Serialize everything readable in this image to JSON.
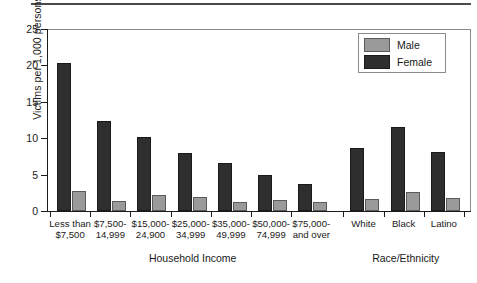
{
  "chart_data": {
    "type": "bar",
    "title": "",
    "xlabel": "",
    "ylabel": "Victims per 1,000 persons",
    "ylim": [
      0,
      25
    ],
    "yticks": [
      0,
      5,
      10,
      15,
      20,
      25
    ],
    "ytick_labels": [
      "0",
      "5",
      "10",
      "15",
      "20",
      "25"
    ],
    "grid": false,
    "legend_position": "top-right",
    "categories": [
      "Less than $7,500",
      "$7,500-14,999",
      "$15,000-24,900",
      "$25,000-34,999",
      "$35,000-49,999",
      "$50,000-74,999",
      "$75,000- and over",
      "White",
      "Black",
      "Latino"
    ],
    "category_labels": [
      {
        "line1": "Less than",
        "line2": "$7,500"
      },
      {
        "line1": "$7,500-",
        "line2": "14,999"
      },
      {
        "line1": "$15,000-",
        "line2": "24,900"
      },
      {
        "line1": "$25,000-",
        "line2": "34,999"
      },
      {
        "line1": "$35,000-",
        "line2": "49,999"
      },
      {
        "line1": "$50,000-",
        "line2": "74,999"
      },
      {
        "line1": "$75,000-",
        "line2": "and over"
      },
      {
        "line1": "White",
        "line2": ""
      },
      {
        "line1": "Black",
        "line2": ""
      },
      {
        "line1": "Latino",
        "line2": ""
      }
    ],
    "series": [
      {
        "name": "Male",
        "color": "#9a9a9a",
        "values": [
          2.8,
          1.4,
          2.2,
          1.9,
          1.2,
          1.5,
          1.2,
          1.7,
          2.6,
          1.8
        ]
      },
      {
        "name": "Female",
        "color": "#2e2e2e",
        "values": [
          20.3,
          12.4,
          10.2,
          8.0,
          6.6,
          4.9,
          3.7,
          8.6,
          11.5,
          8.1
        ]
      }
    ],
    "group_axis_titles": [
      {
        "label": "Household Income",
        "span": [
          0,
          6
        ]
      },
      {
        "label": "Race/Ethnicity",
        "span": [
          7,
          9
        ]
      }
    ]
  },
  "legend": {
    "items": [
      {
        "label": "Male",
        "color": "#9a9a9a"
      },
      {
        "label": "Female",
        "color": "#2e2e2e"
      }
    ]
  }
}
